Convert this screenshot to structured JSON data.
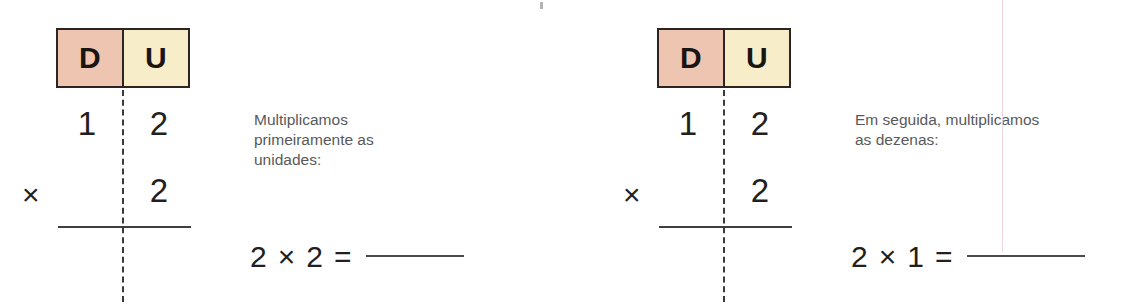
{
  "colors": {
    "tens_cell_bg": "#edc5b0",
    "ones_cell_bg": "#f7eec9",
    "border": "#2b2423",
    "ink": "#231f20",
    "caption_text": "#58595b",
    "margin_guide": "#f0ced6",
    "page_bg": "#ffffff"
  },
  "panels": [
    {
      "id": "step-1",
      "place_value_header": {
        "tens_label": "D",
        "ones_label": "U"
      },
      "vertical_sum": {
        "multiplicand_tens": "1",
        "multiplicand_ones": "2",
        "multiplier_ones": "2",
        "operator": "×"
      },
      "caption": "Multiplicamos primeiramente as unidades:",
      "equation": {
        "left_operand": "2",
        "operator": "×",
        "right_operand": "2",
        "equals": "=",
        "answer": ""
      }
    },
    {
      "id": "step-2",
      "place_value_header": {
        "tens_label": "D",
        "ones_label": "U"
      },
      "vertical_sum": {
        "multiplicand_tens": "1",
        "multiplicand_ones": "2",
        "multiplier_ones": "2",
        "operator": "×"
      },
      "caption": "Em seguida, multiplicamos as dezenas:",
      "equation": {
        "left_operand": "2",
        "operator": "×",
        "right_operand": "1",
        "equals": "=",
        "answer": ""
      }
    }
  ]
}
